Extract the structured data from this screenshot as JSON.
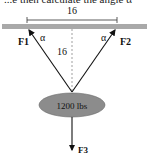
{
  "top_text": "...e then calculate the angle α",
  "diagram": {
    "width_label": "16",
    "height_label": "16",
    "angle_left": "α",
    "angle_right": "α",
    "force_left": "F1",
    "force_right": "F2",
    "force_down": "F3",
    "weight_label": "1200 lbs",
    "colors": {
      "beam": "#a9a9a9",
      "weight": "#8c8c8c",
      "line": "#111111"
    }
  }
}
